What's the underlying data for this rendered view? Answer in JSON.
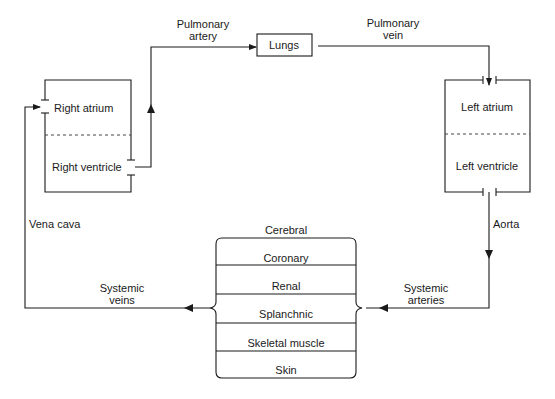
{
  "diagram": {
    "heart_right": {
      "atrium": "Right atrium",
      "ventricle": "Right ventricle"
    },
    "heart_left": {
      "atrium": "Left atrium",
      "ventricle": "Left ventricle"
    },
    "lungs": "Lungs",
    "vessels": {
      "pulmonary_artery_1": "Pulmonary",
      "pulmonary_artery_2": "artery",
      "pulmonary_vein_1": "Pulmonary",
      "pulmonary_vein_2": "vein",
      "aorta": "Aorta",
      "vena_cava": "Vena cava",
      "systemic_arteries_1": "Systemic",
      "systemic_arteries_2": "arteries",
      "systemic_veins_1": "Systemic",
      "systemic_veins_2": "veins"
    },
    "organs": [
      "Cerebral",
      "Coronary",
      "Renal",
      "Splanchnic",
      "Skeletal muscle",
      "Skin"
    ],
    "colors": {
      "line": "#1a1a1a",
      "background": "#ffffff"
    }
  }
}
